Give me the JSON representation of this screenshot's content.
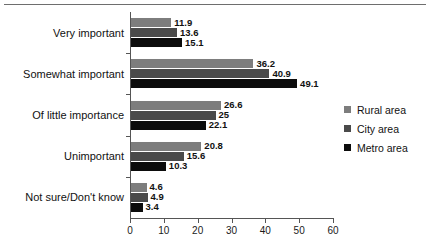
{
  "chart_data": {
    "type": "bar",
    "orientation": "horizontal",
    "title": "",
    "subtitle": "",
    "xlabel": "",
    "ylabel": "",
    "xlim": [
      0,
      60
    ],
    "xticks": [
      0,
      10,
      20,
      30,
      40,
      50,
      60
    ],
    "xticklabels": [
      "0",
      "10",
      "20",
      "30",
      "40",
      "50",
      "60"
    ],
    "grid": false,
    "legend_position": "right",
    "categories": [
      "Very important",
      "Somewhat important",
      "Of little importance",
      "Unimportant",
      "Not sure/Don't know"
    ],
    "series": [
      {
        "name": "Rural area",
        "color": "#7d7d7d",
        "values": [
          11.9,
          36.2,
          26.6,
          20.8,
          4.6
        ],
        "labels": [
          "11.9",
          "36.2",
          "26.6",
          "20.8",
          "4.6"
        ]
      },
      {
        "name": "City area",
        "color": "#4a4a4a",
        "values": [
          13.6,
          40.9,
          25,
          15.6,
          4.9
        ],
        "labels": [
          "13.6",
          "40.9",
          "25",
          "15.6",
          "4.9"
        ]
      },
      {
        "name": "Metro area",
        "color": "#0c0c0c",
        "values": [
          15.1,
          49.1,
          22.1,
          10.3,
          3.4
        ],
        "labels": [
          "15.1",
          "49.1",
          "22.1",
          "10.3",
          "3.4"
        ]
      }
    ]
  },
  "legend": {
    "items": [
      {
        "label": "Rural area",
        "color": "#7d7d7d"
      },
      {
        "label": "City area",
        "color": "#4a4a4a"
      },
      {
        "label": "Metro area",
        "color": "#0c0c0c"
      }
    ]
  }
}
